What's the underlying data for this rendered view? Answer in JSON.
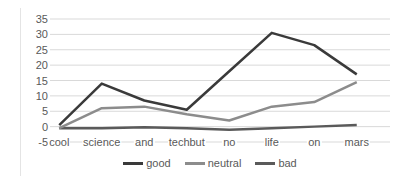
{
  "chart_data": {
    "type": "line",
    "title": "",
    "xlabel": "",
    "ylabel": "",
    "categories": [
      "cool",
      "science",
      "and",
      "techbut",
      "no",
      "life",
      "on",
      "mars"
    ],
    "yticks": [
      "35",
      "30",
      "25",
      "20",
      "15",
      "10",
      "5",
      "0",
      "-5"
    ],
    "ylim": [
      -5,
      35
    ],
    "grid": true,
    "legend_position": "bottom",
    "series": [
      {
        "name": "good",
        "color": "#3a3a3a",
        "values": [
          0.5,
          14,
          8.5,
          5.5,
          18,
          30.5,
          26.5,
          17
        ]
      },
      {
        "name": "neutral",
        "color": "#8c8c8c",
        "values": [
          -0.5,
          6,
          6.5,
          4,
          2,
          6.5,
          8,
          14.5
        ]
      },
      {
        "name": "bad",
        "color": "#5a5a5a",
        "values": [
          -0.5,
          -0.5,
          -0.2,
          -0.5,
          -1,
          -0.5,
          0,
          0.5
        ]
      }
    ]
  },
  "legend": {
    "items": [
      {
        "label": "good",
        "color": "#3a3a3a"
      },
      {
        "label": "neutral",
        "color": "#8c8c8c"
      },
      {
        "label": "bad",
        "color": "#5a5a5a"
      }
    ]
  }
}
